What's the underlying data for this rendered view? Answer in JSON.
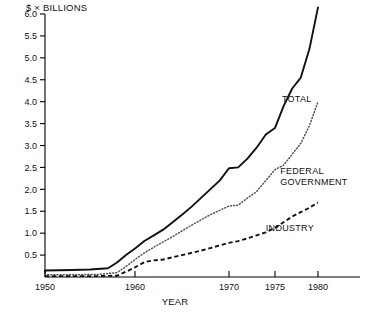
{
  "chart_data": {
    "type": "line",
    "title": "",
    "ylabel": "$ × BILLIONS",
    "xlabel": "YEAR",
    "ylim": [
      0.0,
      6.0
    ],
    "xlim": [
      1947,
      1982
    ],
    "grid": false,
    "legend_position": "inline-right",
    "y_ticks": [
      "0.5",
      "1.0",
      "1.5",
      "2.0",
      "2.5",
      "3.0",
      "3.5",
      "4.0",
      "4.5",
      "5.0",
      "5.5",
      "6.0"
    ],
    "y_tick_values": [
      0.5,
      1.0,
      1.5,
      2.0,
      2.5,
      3.0,
      3.5,
      4.0,
      4.5,
      5.0,
      5.5,
      6.0
    ],
    "x_ticks": [
      "1950",
      "1960",
      "1970",
      "1975",
      "1980"
    ],
    "x_tick_values": [
      1950,
      1960,
      1970,
      1975,
      1980
    ],
    "x_axis_note": "non-linear spacing: 1950-1960 and 1960-1970 decades are compressed relative to 1970-1975-1980",
    "series": [
      {
        "name": "TOTAL",
        "style": "solid",
        "label_x": 1975.8,
        "label_y": 4.0,
        "x": [
          1947,
          1950,
          1953,
          1955,
          1957,
          1958,
          1959,
          1960,
          1961,
          1962,
          1963,
          1964,
          1965,
          1966,
          1967,
          1968,
          1969,
          1970,
          1971,
          1972,
          1973,
          1974,
          1975,
          1976,
          1977,
          1978,
          1979,
          1980
        ],
        "values": [
          0.13,
          0.15,
          0.16,
          0.17,
          0.2,
          0.33,
          0.5,
          0.65,
          0.82,
          0.95,
          1.08,
          1.25,
          1.42,
          1.6,
          1.8,
          2.0,
          2.2,
          2.48,
          2.5,
          2.7,
          2.95,
          3.25,
          3.4,
          3.9,
          4.3,
          4.55,
          5.2,
          6.15
        ]
      },
      {
        "name": "FEDERAL GOVERNMENT",
        "style": "dotted",
        "label_x": 1975.6,
        "label_y": 2.35,
        "label_lines": [
          "FEDERAL",
          "GOVERNMENT"
        ],
        "x": [
          1947,
          1950,
          1953,
          1956,
          1958,
          1959,
          1960,
          1961,
          1962,
          1963,
          1964,
          1965,
          1966,
          1967,
          1968,
          1969,
          1970,
          1971,
          1972,
          1973,
          1974,
          1975,
          1976,
          1977,
          1978,
          1979,
          1980
        ],
        "values": [
          0.04,
          0.05,
          0.05,
          0.06,
          0.1,
          0.24,
          0.4,
          0.55,
          0.68,
          0.8,
          0.92,
          1.05,
          1.18,
          1.3,
          1.42,
          1.52,
          1.62,
          1.64,
          1.8,
          1.95,
          2.2,
          2.45,
          2.55,
          2.8,
          3.05,
          3.45,
          4.0
        ]
      },
      {
        "name": "INDUSTRY",
        "style": "dashed",
        "label_x": 1974.0,
        "label_y": 1.05,
        "x": [
          1947,
          1950,
          1953,
          1956,
          1958,
          1959,
          1960,
          1961,
          1962,
          1963,
          1964,
          1965,
          1966,
          1967,
          1968,
          1969,
          1970,
          1971,
          1972,
          1973,
          1974,
          1975,
          1976,
          1977,
          1978,
          1979,
          1980
        ],
        "values": [
          0.02,
          0.02,
          0.02,
          0.02,
          0.03,
          0.12,
          0.22,
          0.34,
          0.38,
          0.4,
          0.45,
          0.5,
          0.55,
          0.6,
          0.66,
          0.72,
          0.78,
          0.82,
          0.88,
          0.95,
          1.02,
          1.12,
          1.25,
          1.38,
          1.48,
          1.58,
          1.7
        ]
      }
    ]
  },
  "labels": {
    "y_axis_title": "$ × BILLIONS",
    "x_axis_title": "YEAR",
    "total": "TOTAL",
    "federal_line1": "FEDERAL",
    "federal_line2": "GOVERNMENT",
    "industry": "INDUSTRY"
  }
}
